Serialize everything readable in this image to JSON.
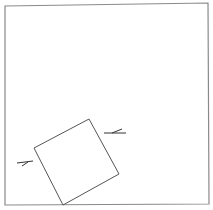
{
  "diagram": {
    "colors": {
      "background": "#ffffff",
      "frame_stroke": "#8a8a8a",
      "square_stroke": "#555555",
      "marker_stroke": "#333333"
    },
    "frame": {
      "points": "5,6 208,3 209,204 5,205"
    },
    "square": {
      "points": "34,148 89,119 119,174 63,205"
    },
    "markers": [
      {
        "name": "right-marker",
        "d": "M104,133 L126,133 M112,133 L122,129"
      },
      {
        "name": "left-marker",
        "d": "M17,163 L33,161 M22,166 L28,162"
      }
    ]
  }
}
